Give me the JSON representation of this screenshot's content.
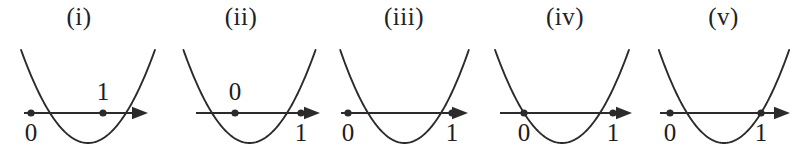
{
  "figure": {
    "background_color": "#ffffff",
    "stroke_color": "#2b2b2b",
    "width": 801,
    "height": 156,
    "axis_y": 113
  },
  "panels": [
    {
      "id": "panel-i",
      "label": "(i)",
      "left": 0,
      "width": 158,
      "axis": {
        "x_start": 24,
        "x_end": 148,
        "y": 113,
        "arrow_end": "right"
      },
      "parabola": {
        "left_root": 50,
        "right_root": 126,
        "vertex_x": 88,
        "vertex_y": 143,
        "top_y": 50
      },
      "points": [
        {
          "name": "zero",
          "label": "0",
          "x": 31,
          "label_position": "below"
        },
        {
          "name": "one",
          "label": "1",
          "x": 103,
          "label_position": "above"
        }
      ],
      "relation": "0 left of both roots, 1 strictly between the roots"
    },
    {
      "id": "panel-ii",
      "label": "(ii)",
      "left": 158,
      "width": 166,
      "axis": {
        "x_start": 196,
        "x_end": 320,
        "y": 113,
        "arrow_end": "right"
      },
      "parabola": {
        "left_root": 212,
        "right_root": 287,
        "vertex_x": 250,
        "vertex_y": 143,
        "top_y": 50
      },
      "points": [
        {
          "name": "zero",
          "label": "0",
          "x": 235,
          "label_position": "above"
        },
        {
          "name": "one",
          "label": "1",
          "x": 301,
          "label_position": "below"
        }
      ],
      "relation": "0 strictly between the roots, 1 right of both roots"
    },
    {
      "id": "panel-iii",
      "label": "(iii)",
      "left": 324,
      "width": 160,
      "axis": {
        "x_start": 341,
        "x_end": 468,
        "y": 113,
        "arrow_end": "right"
      },
      "parabola": {
        "left_root": 368,
        "right_root": 441,
        "vertex_x": 404,
        "vertex_y": 143,
        "top_y": 50
      },
      "points": [
        {
          "name": "zero",
          "label": "0",
          "x": 348,
          "label_position": "below"
        },
        {
          "name": "one",
          "label": "1",
          "x": 452,
          "label_position": "below"
        }
      ],
      "relation": "0 left of both roots, 1 right of both roots"
    },
    {
      "id": "panel-iv",
      "label": "(iv)",
      "left": 484,
      "width": 162,
      "axis": {
        "x_start": 500,
        "x_end": 632,
        "y": 113,
        "arrow_end": "right"
      },
      "parabola": {
        "left_root": 524,
        "right_root": 600,
        "vertex_x": 562,
        "vertex_y": 143,
        "top_y": 50
      },
      "points": [
        {
          "name": "zero",
          "label": "0",
          "x": 524,
          "label_position": "below"
        },
        {
          "name": "one",
          "label": "1",
          "x": 613,
          "label_position": "below"
        }
      ],
      "relation": "0 exactly on the left root, 1 right of both roots"
    },
    {
      "id": "panel-v",
      "left": 646,
      "label": "(v)",
      "width": 155,
      "axis": {
        "x_start": 660,
        "x_end": 790,
        "y": 113,
        "arrow_end": "right"
      },
      "parabola": {
        "left_root": 687,
        "right_root": 761,
        "vertex_x": 724,
        "vertex_y": 143,
        "top_y": 50
      },
      "points": [
        {
          "name": "zero",
          "label": "0",
          "x": 670,
          "label_position": "below"
        },
        {
          "name": "one",
          "label": "1",
          "x": 761,
          "label_position": "below"
        }
      ],
      "relation": "0 left of both roots, 1 exactly on the right root"
    }
  ]
}
